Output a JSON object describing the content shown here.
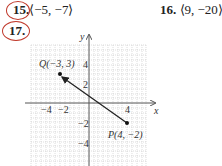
{
  "problems": [
    {
      "number": "15.",
      "answer": "⟨−5, −7⟩",
      "circled": true
    },
    {
      "number": "16.",
      "answer": "⟨9, −20⟩",
      "circled": false
    },
    {
      "number": "17.",
      "answer": "",
      "circled": true
    }
  ],
  "graph": {
    "x_axis_label": "x",
    "y_axis_label": "y",
    "x_ticks": [
      "−4",
      "−2",
      "4"
    ],
    "y_ticks": [
      "4",
      "2",
      "−2",
      "−4"
    ],
    "point_q": {
      "label": "Q(−3, 3)",
      "x": -3,
      "y": 3
    },
    "point_p": {
      "label": "P(4, −2)",
      "x": 4,
      "y": -2
    },
    "vector_direction": "from P to Q",
    "annotation_color": "#c0392b"
  }
}
